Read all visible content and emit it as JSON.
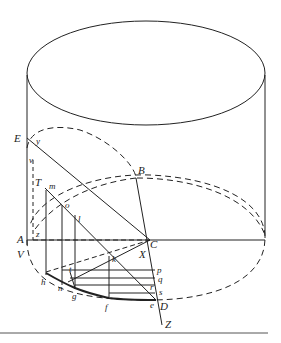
{
  "diagram": {
    "type": "cylinder-geometry",
    "stroke_color": "#222222",
    "labels": {
      "E": "E",
      "y": "y",
      "v": "v",
      "T": "T",
      "m": "m",
      "o": "o",
      "l": "l",
      "A": "A",
      "z": "z",
      "V": "V",
      "B": "B",
      "C": "C",
      "X": "X",
      "k": "k",
      "h": "h",
      "n": "n",
      "t": "t",
      "g": "g",
      "f": "f",
      "p": "p",
      "q": "q",
      "r": "r",
      "s": "s",
      "e": "e",
      "D": "D",
      "Z": "Z"
    }
  }
}
